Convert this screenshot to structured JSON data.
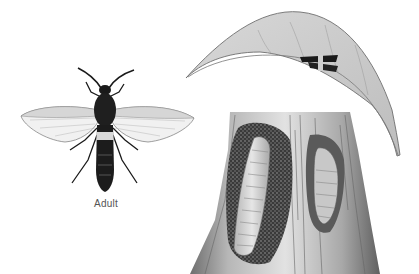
{
  "illustration": {
    "subject": "insect life stages illustration",
    "caption_adult": "Adult",
    "panels": [
      {
        "name": "adult",
        "description": "clearwing moth adult, dorsal view, wings spread"
      },
      {
        "name": "leaf",
        "description": "curved leaf with small moth resting on it"
      },
      {
        "name": "trunk",
        "description": "tree trunk cross-section with larva in frass-filled gallery and pupa in chamber"
      }
    ]
  },
  "colors": {
    "background": "#ffffff",
    "ink": "#1a1a1a",
    "leaf_fill": "#c9c9c9",
    "leaf_edge": "#6e6e6e",
    "wing_fill": "#f1f1f1",
    "band": "#d8d8d8",
    "larva": "#d2d2d2",
    "frass": "#3a3a3a",
    "caption": "#555555"
  }
}
